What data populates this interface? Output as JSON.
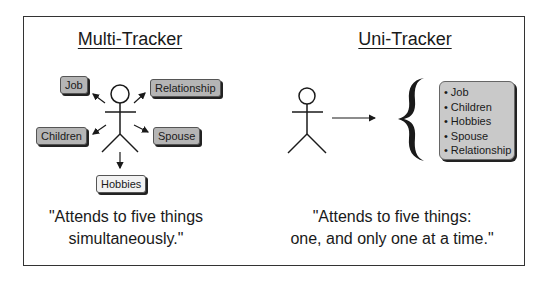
{
  "left_panel": {
    "title": "Multi-Tracker",
    "tags": {
      "job": "Job",
      "relationship": "Relationship",
      "children": "Children",
      "spouse": "Spouse",
      "hobbies": "Hobbies"
    },
    "quote_line1": "\"Attends to five things",
    "quote_line2": "simultaneously.\""
  },
  "right_panel": {
    "title": "Uni-Tracker",
    "list": [
      "Job",
      "Children",
      "Hobbies",
      "Spouse",
      "Relationship"
    ],
    "quote_line1": "\"Attends to five things:",
    "quote_line2": "one, and only one at a time.\""
  },
  "colors": {
    "tag_fill": "#b5b5b5",
    "tag_light_fill": "#f2f2f2",
    "list_fill": "#c9c9c9",
    "stroke": "#1a1a1a"
  }
}
